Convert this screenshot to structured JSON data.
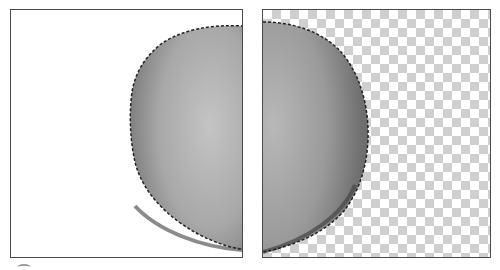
{
  "figure": {
    "panels": [
      {
        "id": "left",
        "label": "",
        "background": "white",
        "selection": "dashed-outline"
      },
      {
        "id": "right",
        "label": "",
        "background": "transparency-checkerboard",
        "selection": "dashed-outline"
      }
    ],
    "colors": {
      "border": "#4a4a4a",
      "object_light": "#b5b5b5",
      "object_dark": "#6a6a6a",
      "checker_gray": "#cfcfcf",
      "checker_white": "#ffffff"
    },
    "checker_size_px": 9
  }
}
